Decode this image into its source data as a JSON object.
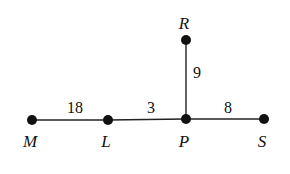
{
  "diagram": {
    "points": [
      {
        "id": "M",
        "label": "M",
        "x": 32,
        "y": 120,
        "lx": 30,
        "ly": 147
      },
      {
        "id": "L",
        "label": "L",
        "x": 108,
        "y": 120,
        "lx": 106,
        "ly": 147
      },
      {
        "id": "P",
        "label": "P",
        "x": 186,
        "y": 119,
        "lx": 184,
        "ly": 147
      },
      {
        "id": "S",
        "label": "S",
        "x": 264,
        "y": 119,
        "lx": 262,
        "ly": 147
      },
      {
        "id": "R",
        "label": "R",
        "x": 186,
        "y": 40,
        "lx": 184,
        "ly": 29
      }
    ],
    "segments": [
      {
        "from": "M",
        "to": "L",
        "length": "18",
        "lx": 75,
        "ly": 113
      },
      {
        "from": "L",
        "to": "P",
        "length": "3",
        "lx": 151,
        "ly": 113
      },
      {
        "from": "P",
        "to": "S",
        "length": "8",
        "lx": 228,
        "ly": 113
      },
      {
        "from": "P",
        "to": "R",
        "length": "9",
        "lx": 197,
        "ly": 78
      }
    ]
  }
}
